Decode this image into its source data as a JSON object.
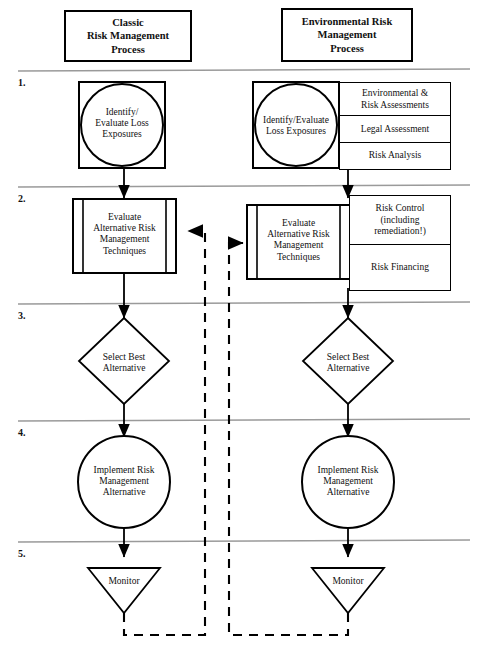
{
  "diagram": {
    "title_left": "Classic Risk Management Process",
    "title_right": "Environmental Risk Management Process",
    "colors": {
      "stroke": "#000000",
      "separator": "#9a9a9a",
      "background": "#ffffff"
    }
  },
  "headers": {
    "left": {
      "line1": "Classic",
      "line2": "Risk Management",
      "line3": "Process"
    },
    "right": {
      "line1": "Environmental Risk",
      "line2": "Management",
      "line3": "Process"
    }
  },
  "steps": [
    {
      "number": "1."
    },
    {
      "number": "2."
    },
    {
      "number": "3."
    },
    {
      "number": "4."
    },
    {
      "number": "5."
    }
  ],
  "left_column": {
    "step1": {
      "shape": "circle-in-square",
      "line1": "Identify/",
      "line2": "Evaluate Loss",
      "line3": "Exposures"
    },
    "step2": {
      "shape": "predefined-process",
      "line1": "Evaluate",
      "line2": "Alternative Risk",
      "line3": "Management",
      "line4": "Techniques"
    },
    "step3": {
      "shape": "diamond",
      "line1": "Select Best",
      "line2": "Alternative"
    },
    "step4": {
      "shape": "circle",
      "line1": "Implement Risk",
      "line2": "Management",
      "line3": "Alternative"
    },
    "step5": {
      "shape": "triangle-down",
      "line1": "Monitor"
    }
  },
  "right_column": {
    "step1": {
      "shape": "circle-in-square",
      "line1": "Identify/Evaluate",
      "line2": "Loss Exposures"
    },
    "step1_side": [
      {
        "line1": "Environmental &",
        "line2": "Risk Assessments"
      },
      {
        "line1": "Legal Assessment"
      },
      {
        "line1": "Risk Analysis"
      }
    ],
    "step2": {
      "shape": "predefined-process",
      "line1": "Evaluate",
      "line2": "Alternative Risk",
      "line3": "Management",
      "line4": "Techniques"
    },
    "step2_side": [
      {
        "line1": "Risk Control",
        "line2": "(including",
        "line3": "remediation!)"
      },
      {
        "line1": "Risk Financing"
      }
    ],
    "step3": {
      "shape": "diamond",
      "line1": "Select Best",
      "line2": "Alternative"
    },
    "step4": {
      "shape": "circle",
      "line1": "Implement Risk",
      "line2": "Management",
      "line3": "Alternative"
    },
    "step5": {
      "shape": "triangle-down",
      "line1": "Monitor"
    }
  },
  "connectors": {
    "feedback_left_label": "Monitor feedback to Evaluate Alternatives (classic)",
    "feedback_right_label": "Monitor feedback to Evaluate Alternatives (environmental)",
    "style": "dashed"
  },
  "footer": {
    "caption": ""
  }
}
